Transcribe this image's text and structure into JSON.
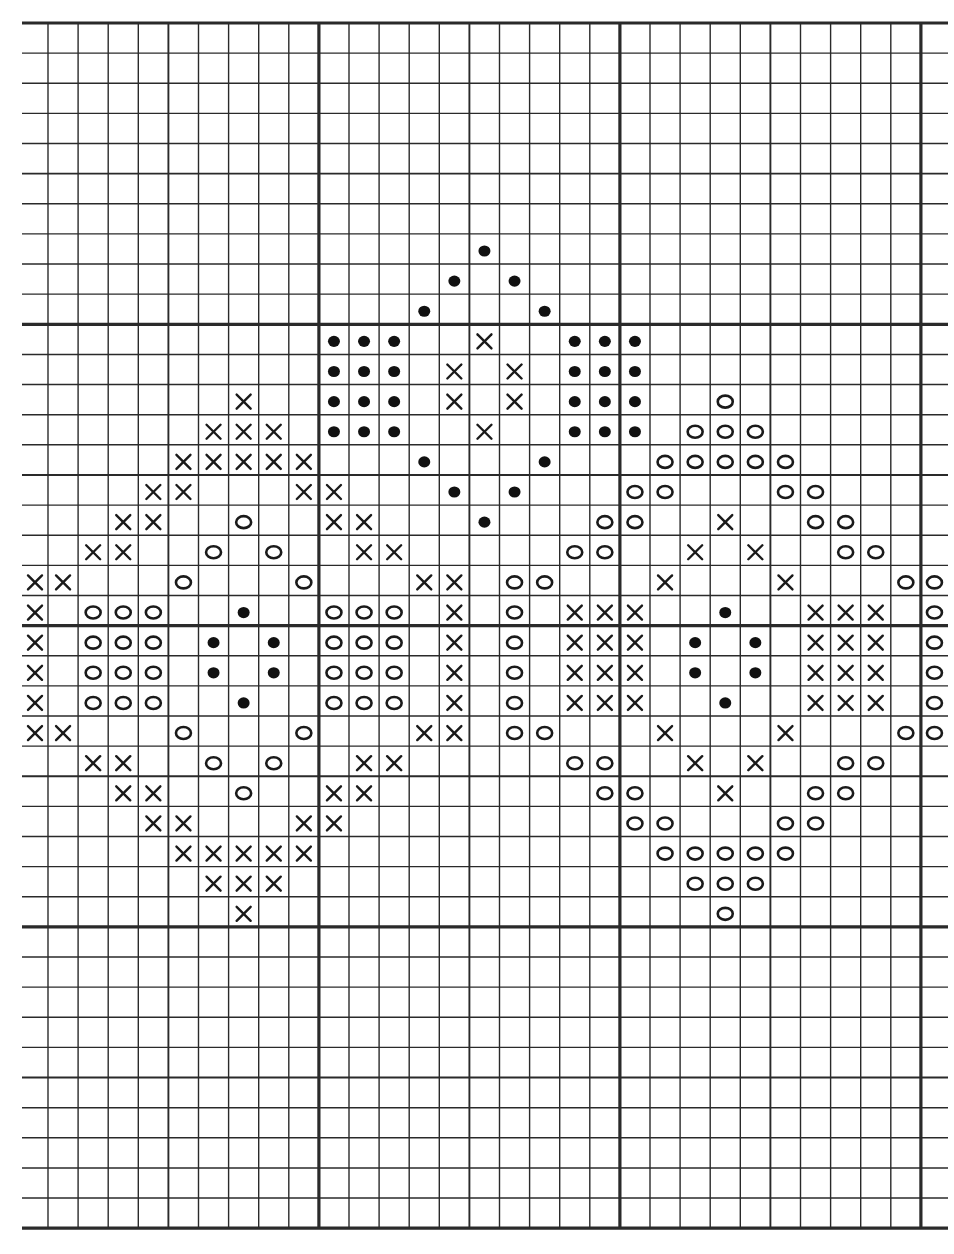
{
  "chart_data": {
    "type": "table",
    "title": "",
    "grid": {
      "rows": 40,
      "cols": 31,
      "origin_x": 22,
      "first_vertical_x": 48,
      "col_width": 30.1,
      "origin_y": 23,
      "row_height": 30.13,
      "right_edge_x": 948,
      "heavy_every": 10,
      "heavy_vertical_cols": [
        10,
        20,
        30
      ],
      "heavy_horizontal_rows": [
        0,
        10,
        20,
        30,
        40
      ],
      "medium_vertical_cols": [
        5,
        15,
        25
      ],
      "medium_horizontal_rows": [
        5,
        15,
        25,
        35
      ]
    },
    "legend": [
      {
        "symbol": "x",
        "name": "cross"
      },
      {
        "symbol": "o",
        "name": "open circle"
      },
      {
        "symbol": "dot",
        "name": "filled dot"
      }
    ],
    "cells": {
      "7": {
        "dot": [
          15
        ]
      },
      "8": {
        "dot": [
          14,
          16
        ]
      },
      "9": {
        "dot": [
          13,
          17
        ]
      },
      "10": {
        "dot": [
          10,
          11,
          12,
          18,
          19,
          20
        ],
        "x": [
          15
        ]
      },
      "11": {
        "dot": [
          10,
          11,
          12,
          18,
          19,
          20
        ],
        "x": [
          14,
          16
        ]
      },
      "12": {
        "x": [
          7,
          14,
          16
        ],
        "dot": [
          10,
          11,
          12,
          18,
          19,
          20
        ],
        "o": [
          23
        ]
      },
      "13": {
        "x": [
          6,
          7,
          8,
          15
        ],
        "dot": [
          10,
          11,
          12,
          18,
          19,
          20
        ],
        "o": [
          22,
          23,
          24
        ]
      },
      "14": {
        "x": [
          5,
          6,
          7,
          8,
          9
        ],
        "dot": [
          13,
          17
        ],
        "o": [
          21,
          22,
          23,
          24,
          25
        ]
      },
      "15": {
        "x": [
          4,
          5,
          9,
          10
        ],
        "dot": [
          14,
          16
        ],
        "o": [
          20,
          21,
          25,
          26
        ]
      },
      "16": {
        "x": [
          3,
          4,
          10,
          11,
          23
        ],
        "o": [
          7,
          19,
          20,
          26,
          27
        ],
        "dot": [
          15
        ]
      },
      "17": {
        "x": [
          2,
          3,
          11,
          12,
          22,
          24
        ],
        "o": [
          6,
          8,
          18,
          19,
          27,
          28
        ]
      },
      "18": {
        "x": [
          0,
          1,
          13,
          14,
          21,
          25
        ],
        "o": [
          5,
          9,
          16,
          17,
          29,
          30
        ]
      },
      "19": {
        "x": [
          0,
          14,
          18,
          19,
          20,
          26,
          27,
          28
        ],
        "o": [
          2,
          3,
          4,
          10,
          11,
          12,
          16,
          30
        ],
        "dot": [
          7,
          23
        ]
      },
      "20": {
        "x": [
          0,
          14,
          18,
          19,
          20,
          26,
          27,
          28
        ],
        "o": [
          2,
          3,
          4,
          10,
          11,
          12,
          16,
          30
        ],
        "dot": [
          6,
          8,
          22,
          24
        ]
      },
      "21": {
        "x": [
          0,
          14,
          18,
          19,
          20,
          26,
          27,
          28
        ],
        "o": [
          2,
          3,
          4,
          10,
          11,
          12,
          16,
          30
        ],
        "dot": [
          6,
          8,
          22,
          24
        ]
      },
      "22": {
        "x": [
          0,
          14,
          18,
          19,
          20,
          26,
          27,
          28
        ],
        "o": [
          2,
          3,
          4,
          10,
          11,
          12,
          16,
          30
        ],
        "dot": [
          7,
          23
        ]
      },
      "23": {
        "x": [
          0,
          1,
          13,
          14,
          21,
          25
        ],
        "o": [
          5,
          9,
          16,
          17,
          29,
          30
        ]
      },
      "24": {
        "x": [
          2,
          3,
          11,
          12,
          22,
          24
        ],
        "o": [
          6,
          8,
          18,
          19,
          27,
          28
        ]
      },
      "25": {
        "x": [
          3,
          4,
          10,
          11,
          23
        ],
        "o": [
          7,
          19,
          20,
          26,
          27
        ]
      },
      "26": {
        "x": [
          4,
          5,
          9,
          10
        ],
        "o": [
          20,
          21,
          25,
          26
        ]
      },
      "27": {
        "x": [
          5,
          6,
          7,
          8,
          9
        ],
        "o": [
          21,
          22,
          23,
          24,
          25
        ]
      },
      "28": {
        "x": [
          6,
          7,
          8
        ],
        "o": [
          22,
          23,
          24
        ]
      },
      "29": {
        "x": [
          7
        ],
        "o": [
          23
        ]
      }
    },
    "colors": {
      "paper": "#ffffff",
      "ink": "#1a1a1a"
    }
  }
}
